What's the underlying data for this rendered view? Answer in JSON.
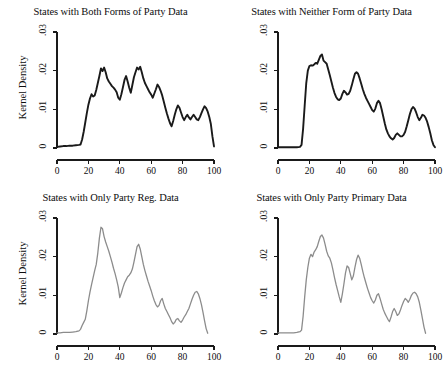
{
  "figure": {
    "layout": "2x2-grid",
    "width": 442,
    "height": 372,
    "background": "#ffffff"
  },
  "axis": {
    "ylabel": "Kernel Density",
    "xticks": [
      "0",
      "20",
      "40",
      "60",
      "80",
      "100"
    ],
    "xtick_values": [
      0,
      20,
      40,
      60,
      80,
      100
    ],
    "yticks": [
      ".03",
      ".02",
      ".01",
      "0"
    ],
    "ytick_values": [
      0.03,
      0.02,
      0.01,
      0
    ],
    "xlim": [
      0,
      100
    ],
    "ylim": [
      0,
      0.03
    ]
  },
  "colors": {
    "line_dark": "#1a1a1a",
    "line_light": "#8c8c8c",
    "axis": "#1a1a1a",
    "text": "#0d0d0d"
  },
  "chart_data": [
    {
      "type": "line",
      "panel": "top-left",
      "title": "States with Both Forms of Party Data",
      "xlabel": "",
      "ylabel": "Kernel Density",
      "xlim": [
        0,
        100
      ],
      "ylim": [
        0,
        0.03
      ],
      "grid": false,
      "legend": "none",
      "line_color": "#1a1a1a",
      "line_width": 1.9,
      "x": [
        0,
        2,
        4,
        6,
        8,
        10,
        12,
        14,
        15,
        16,
        17,
        18,
        19,
        20,
        21,
        22,
        23,
        24,
        25,
        26,
        27,
        28,
        29,
        30,
        31,
        32,
        33,
        34,
        35,
        36,
        37,
        38,
        39,
        40,
        41,
        42,
        43,
        44,
        45,
        46,
        47,
        48,
        49,
        50,
        51,
        52,
        53,
        54,
        55,
        56,
        57,
        58,
        59,
        60,
        61,
        62,
        63,
        64,
        65,
        66,
        67,
        68,
        69,
        70,
        71,
        72,
        73,
        74,
        75,
        76,
        77,
        78,
        79,
        80,
        81,
        82,
        83,
        84,
        85,
        86,
        87,
        88,
        89,
        90,
        91,
        92,
        93,
        94,
        95,
        96,
        97,
        98,
        99,
        100
      ],
      "y": [
        0.0003,
        0.0004,
        0.0005,
        0.0005,
        0.0006,
        0.0006,
        0.0007,
        0.0008,
        0.0009,
        0.0022,
        0.0042,
        0.0066,
        0.009,
        0.0112,
        0.0128,
        0.0139,
        0.0133,
        0.0136,
        0.015,
        0.0168,
        0.0186,
        0.0206,
        0.0199,
        0.0208,
        0.0196,
        0.018,
        0.0172,
        0.0166,
        0.016,
        0.0156,
        0.0151,
        0.0144,
        0.013,
        0.0125,
        0.0139,
        0.0157,
        0.0176,
        0.0186,
        0.0172,
        0.0156,
        0.0143,
        0.0163,
        0.0183,
        0.0196,
        0.0208,
        0.0203,
        0.021,
        0.0196,
        0.018,
        0.0168,
        0.016,
        0.0152,
        0.0144,
        0.0138,
        0.013,
        0.0141,
        0.0152,
        0.0164,
        0.0158,
        0.0148,
        0.0136,
        0.012,
        0.0104,
        0.0089,
        0.0076,
        0.0064,
        0.0056,
        0.007,
        0.0086,
        0.01,
        0.011,
        0.0104,
        0.0092,
        0.008,
        0.0072,
        0.008,
        0.0086,
        0.0079,
        0.0074,
        0.008,
        0.0086,
        0.008,
        0.0074,
        0.0072,
        0.008,
        0.009,
        0.01,
        0.0108,
        0.0103,
        0.0094,
        0.008,
        0.0062,
        0.003,
        0.0004
      ]
    },
    {
      "type": "line",
      "panel": "top-right",
      "title": "States with Neither Form of Party Data",
      "xlabel": "",
      "ylabel": "",
      "xlim": [
        0,
        100
      ],
      "ylim": [
        0,
        0.03
      ],
      "grid": false,
      "legend": "none",
      "line_color": "#1a1a1a",
      "line_width": 1.9,
      "x": [
        0,
        2,
        4,
        6,
        8,
        10,
        12,
        14,
        15,
        16,
        17,
        18,
        19,
        20,
        21,
        22,
        23,
        24,
        25,
        26,
        27,
        28,
        29,
        30,
        31,
        32,
        33,
        34,
        35,
        36,
        37,
        38,
        39,
        40,
        41,
        42,
        43,
        44,
        45,
        46,
        47,
        48,
        49,
        50,
        51,
        52,
        53,
        54,
        55,
        56,
        57,
        58,
        59,
        60,
        61,
        62,
        63,
        64,
        65,
        66,
        67,
        68,
        69,
        70,
        71,
        72,
        73,
        74,
        75,
        76,
        77,
        78,
        79,
        80,
        81,
        82,
        83,
        84,
        85,
        86,
        87,
        88,
        89,
        90,
        91,
        92,
        93,
        94,
        95,
        96,
        97,
        98,
        99,
        100
      ],
      "y": [
        0.0002,
        0.0002,
        0.0002,
        0.0002,
        0.0002,
        0.0002,
        0.0002,
        0.0003,
        0.0008,
        0.005,
        0.011,
        0.0168,
        0.02,
        0.0212,
        0.0214,
        0.0213,
        0.0216,
        0.022,
        0.0218,
        0.0228,
        0.0238,
        0.0242,
        0.0226,
        0.0222,
        0.0218,
        0.0203,
        0.0188,
        0.0172,
        0.0156,
        0.0142,
        0.0132,
        0.0126,
        0.0124,
        0.0128,
        0.014,
        0.0148,
        0.0144,
        0.0138,
        0.014,
        0.0148,
        0.0162,
        0.0178,
        0.0192,
        0.0196,
        0.0192,
        0.018,
        0.0166,
        0.0152,
        0.014,
        0.013,
        0.0122,
        0.0114,
        0.0106,
        0.0098,
        0.0094,
        0.0102,
        0.0116,
        0.0122,
        0.0116,
        0.01,
        0.0082,
        0.0064,
        0.0048,
        0.0038,
        0.003,
        0.0025,
        0.0022,
        0.0026,
        0.0034,
        0.0038,
        0.0034,
        0.003,
        0.003,
        0.0034,
        0.0042,
        0.0056,
        0.0072,
        0.0088,
        0.01,
        0.0106,
        0.0102,
        0.0092,
        0.008,
        0.0072,
        0.0078,
        0.0086,
        0.0084,
        0.0078,
        0.0068,
        0.0054,
        0.0038,
        0.002,
        0.0008,
        0.0002
      ]
    },
    {
      "type": "line",
      "panel": "bottom-left",
      "title": "States with Only Party Reg. Data",
      "xlabel": "",
      "ylabel": "Kernel Density",
      "xlim": [
        0,
        100
      ],
      "ylim": [
        0,
        0.03
      ],
      "grid": false,
      "legend": "none",
      "line_color": "#8c8c8c",
      "line_width": 1.3,
      "x": [
        0,
        2,
        4,
        6,
        8,
        10,
        12,
        14,
        15,
        16,
        17,
        18,
        19,
        20,
        21,
        22,
        23,
        24,
        25,
        26,
        27,
        28,
        29,
        30,
        31,
        32,
        33,
        34,
        35,
        36,
        37,
        38,
        39,
        40,
        41,
        42,
        43,
        44,
        45,
        46,
        47,
        48,
        49,
        50,
        51,
        52,
        53,
        54,
        55,
        56,
        57,
        58,
        59,
        60,
        61,
        62,
        63,
        64,
        65,
        66,
        67,
        68,
        69,
        70,
        71,
        72,
        73,
        74,
        75,
        76,
        77,
        78,
        79,
        80,
        81,
        82,
        83,
        84,
        85,
        86,
        87,
        88,
        89,
        90,
        91,
        92,
        93,
        94,
        95,
        96,
        97,
        98,
        99,
        100
      ],
      "y": [
        0.0003,
        0.0003,
        0.0004,
        0.0004,
        0.0004,
        0.0005,
        0.0006,
        0.0008,
        0.0012,
        0.0022,
        0.003,
        0.0038,
        0.006,
        0.0086,
        0.0108,
        0.0128,
        0.0146,
        0.0164,
        0.018,
        0.021,
        0.0248,
        0.0276,
        0.0272,
        0.0252,
        0.0238,
        0.0226,
        0.0214,
        0.02,
        0.0186,
        0.017,
        0.0156,
        0.014,
        0.0122,
        0.0094,
        0.0106,
        0.012,
        0.0132,
        0.014,
        0.0148,
        0.0152,
        0.0158,
        0.0168,
        0.0186,
        0.0206,
        0.0226,
        0.0232,
        0.022,
        0.02,
        0.018,
        0.0164,
        0.015,
        0.0136,
        0.0124,
        0.0112,
        0.0098,
        0.0086,
        0.0076,
        0.007,
        0.0074,
        0.0086,
        0.0092,
        0.0078,
        0.0066,
        0.0058,
        0.005,
        0.0042,
        0.0032,
        0.0026,
        0.003,
        0.0038,
        0.004,
        0.0034,
        0.003,
        0.0036,
        0.0044,
        0.005,
        0.0058,
        0.0066,
        0.0078,
        0.009,
        0.01,
        0.0108,
        0.011,
        0.0104,
        0.0092,
        0.0076,
        0.0056,
        0.0034,
        0.0014,
        0.0002
      ]
    },
    {
      "type": "line",
      "panel": "bottom-right",
      "title": "States with Only Party Primary Data",
      "xlabel": "",
      "ylabel": "",
      "xlim": [
        0,
        100
      ],
      "ylim": [
        0,
        0.03
      ],
      "grid": false,
      "legend": "none",
      "line_color": "#8c8c8c",
      "line_width": 1.3,
      "x": [
        0,
        2,
        4,
        6,
        8,
        10,
        12,
        14,
        15,
        16,
        17,
        18,
        19,
        20,
        21,
        22,
        23,
        24,
        25,
        26,
        27,
        28,
        29,
        30,
        31,
        32,
        33,
        34,
        35,
        36,
        37,
        38,
        39,
        40,
        41,
        42,
        43,
        44,
        45,
        46,
        47,
        48,
        49,
        50,
        51,
        52,
        53,
        54,
        55,
        56,
        57,
        58,
        59,
        60,
        61,
        62,
        63,
        64,
        65,
        66,
        67,
        68,
        69,
        70,
        71,
        72,
        73,
        74,
        75,
        76,
        77,
        78,
        79,
        80,
        81,
        82,
        83,
        84,
        85,
        86,
        87,
        88,
        89,
        90,
        91,
        92,
        93,
        94,
        95,
        96,
        97,
        98,
        99,
        100
      ],
      "y": [
        0.0003,
        0.0003,
        0.0003,
        0.0003,
        0.0003,
        0.0003,
        0.0004,
        0.0006,
        0.001,
        0.0046,
        0.0096,
        0.014,
        0.0172,
        0.0196,
        0.0206,
        0.02,
        0.0212,
        0.0218,
        0.0226,
        0.024,
        0.0252,
        0.0256,
        0.0248,
        0.0232,
        0.0214,
        0.0202,
        0.0196,
        0.0184,
        0.0166,
        0.0146,
        0.0128,
        0.0112,
        0.0096,
        0.0082,
        0.0104,
        0.013,
        0.0158,
        0.0176,
        0.0172,
        0.0156,
        0.014,
        0.015,
        0.0172,
        0.0192,
        0.0204,
        0.0196,
        0.018,
        0.0162,
        0.0146,
        0.0132,
        0.0118,
        0.0106,
        0.0094,
        0.0086,
        0.008,
        0.0088,
        0.01,
        0.0104,
        0.0092,
        0.0078,
        0.0064,
        0.0054,
        0.0046,
        0.0038,
        0.0032,
        0.0044,
        0.0058,
        0.0066,
        0.0058,
        0.0048,
        0.0052,
        0.0062,
        0.0074,
        0.0084,
        0.0092,
        0.0088,
        0.0082,
        0.009,
        0.01,
        0.0106,
        0.0108,
        0.0104,
        0.0096,
        0.0082,
        0.0062,
        0.004,
        0.0018,
        0.0002
      ]
    }
  ]
}
